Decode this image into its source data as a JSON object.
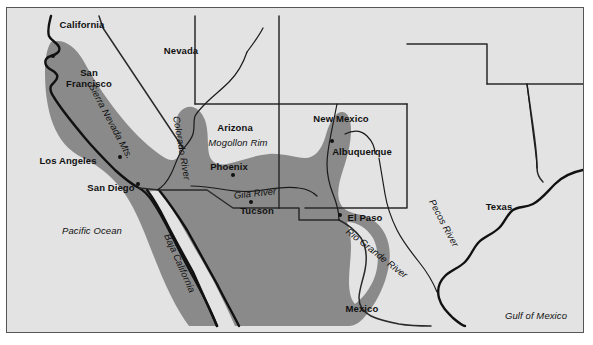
{
  "figure": {
    "kind": "reference-map",
    "colors": {
      "page": "#ffffff",
      "land": "#e3e3e3",
      "shaded_region": "#8a8a8a",
      "coastline": "#111111",
      "state_border": "#2a2a2a",
      "river": "#1a1a1a",
      "frame": "#555555",
      "text": "#111111"
    }
  },
  "states": [
    {
      "name": "California",
      "x": 75,
      "y": 16
    },
    {
      "name": "Nevada",
      "x": 174,
      "y": 42
    },
    {
      "name": "Arizona",
      "x": 228,
      "y": 119
    },
    {
      "name": "New Mexico",
      "x": 334,
      "y": 110
    },
    {
      "name": "Texas",
      "x": 492,
      "y": 198
    },
    {
      "name": "Mexico",
      "x": 355,
      "y": 300
    }
  ],
  "cities": [
    {
      "name": "San Francisco",
      "lines": [
        "San",
        "Francisco"
      ],
      "label_x": 82,
      "label_y": 70,
      "dot_x": 46,
      "dot_y": 48
    },
    {
      "name": "Los Angeles",
      "lines": [
        "Los Angeles"
      ],
      "label_x": 61,
      "label_y": 152,
      "dot_x": 113,
      "dot_y": 149
    },
    {
      "name": "San Diego",
      "lines": [
        "San Diego"
      ],
      "label_x": 104,
      "label_y": 179,
      "dot_x": 131,
      "dot_y": 176
    },
    {
      "name": "Phoenix",
      "lines": [
        "Phoenix"
      ],
      "label_x": 222,
      "label_y": 158,
      "dot_x": 226,
      "dot_y": 167
    },
    {
      "name": "Tucson",
      "lines": [
        "Tucson"
      ],
      "label_x": 250,
      "label_y": 202,
      "dot_x": 244,
      "dot_y": 194
    },
    {
      "name": "Albuquerque",
      "lines": [
        "Albuquerque"
      ],
      "label_x": 355,
      "label_y": 143,
      "dot_x": 325,
      "dot_y": 133
    },
    {
      "name": "El Paso",
      "lines": [
        "El Paso"
      ],
      "label_x": 358,
      "label_y": 209,
      "dot_x": 333,
      "dot_y": 207
    }
  ],
  "features": [
    {
      "name": "Sierra Nevada Mts.",
      "x": 104,
      "y": 113,
      "rotate": 62,
      "size": 9.5
    },
    {
      "name": "Colorado River",
      "x": 175,
      "y": 140,
      "rotate": 80,
      "size": 9.5
    },
    {
      "name": "Mogollon Rim",
      "x": 231,
      "y": 134,
      "rotate": 0,
      "size": 9.5
    },
    {
      "name": "Gila River",
      "x": 248,
      "y": 185,
      "rotate": -6,
      "size": 9.5
    },
    {
      "name": "Rio Grande River",
      "x": 370,
      "y": 245,
      "rotate": 38,
      "size": 9.5
    },
    {
      "name": "Pecos River",
      "x": 437,
      "y": 215,
      "rotate": 62,
      "size": 9.5
    },
    {
      "name": "Baja California",
      "x": 173,
      "y": 255,
      "rotate": 66,
      "size": 9.5
    },
    {
      "name": "Pacific Ocean",
      "x": 85,
      "y": 222,
      "rotate": 0,
      "size": 9.5
    },
    {
      "name": "Gulf of Mexico",
      "x": 529,
      "y": 307,
      "rotate": 0,
      "size": 9.5
    }
  ]
}
